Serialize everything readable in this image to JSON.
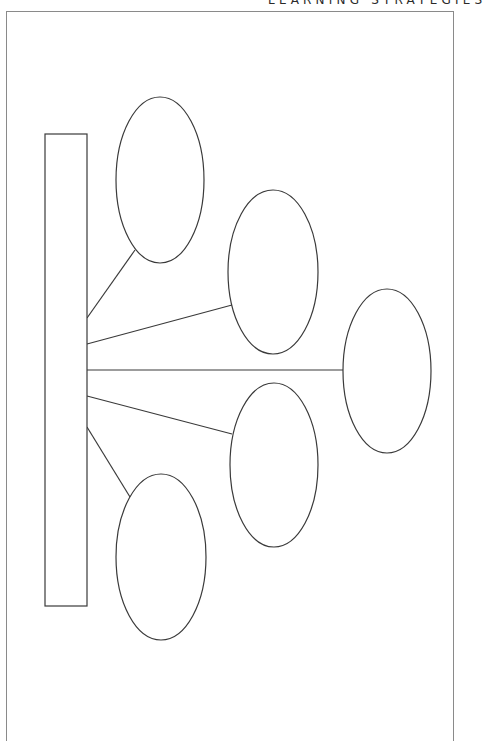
{
  "header": {
    "title": "LEARNING STRATEGIES"
  },
  "diagram": {
    "type": "graphic-organizer",
    "colors": {
      "stroke": "#3a3a3a",
      "frame": "#8a8a8a",
      "background": "#ffffff"
    },
    "main_box": {
      "label": "",
      "x": 45,
      "y": 134,
      "width": 42,
      "height": 472
    },
    "branches": [
      {
        "label": "",
        "cx": 160,
        "cy": 180,
        "rx": 44,
        "ry": 83,
        "line": [
          87,
          318,
          135,
          250
        ]
      },
      {
        "label": "",
        "cx": 273,
        "cy": 272,
        "rx": 45,
        "ry": 82,
        "line": [
          87,
          344,
          232,
          305
        ]
      },
      {
        "label": "",
        "cx": 387,
        "cy": 371,
        "rx": 44,
        "ry": 82,
        "line": [
          87,
          370,
          343,
          370
        ]
      },
      {
        "label": "",
        "cx": 274,
        "cy": 465,
        "rx": 44,
        "ry": 82,
        "line": [
          87,
          396,
          232,
          434
        ]
      },
      {
        "label": "",
        "cx": 161,
        "cy": 557,
        "rx": 45,
        "ry": 83,
        "line": [
          87,
          427,
          130,
          497
        ]
      }
    ]
  }
}
